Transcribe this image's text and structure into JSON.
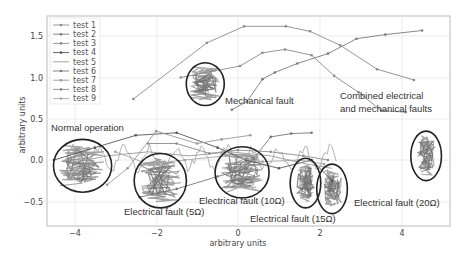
{
  "chart_data": {
    "type": "line",
    "title": "",
    "xlabel": "arbitrary units",
    "ylabel": "arbitrary units",
    "xlim": [
      -4.7,
      5.15
    ],
    "ylim": [
      -0.8,
      1.75
    ],
    "xticks": [
      -4,
      -2,
      0,
      2,
      4
    ],
    "yticks": [
      -0.5,
      0.0,
      0.5,
      1.0,
      1.5
    ],
    "grid": true,
    "legend_position": "upper left",
    "series": [
      {
        "name": "test 1",
        "color": "#8a8a8a",
        "marker": "dot",
        "points": [
          [
            -2.56,
            0.74
          ],
          [
            -0.76,
            1.42
          ],
          [
            0.15,
            1.62
          ],
          [
            1.17,
            1.62
          ],
          [
            1.76,
            1.56
          ],
          [
            2.5,
            1.39
          ],
          [
            3.4,
            1.1
          ],
          [
            4.3,
            0.97
          ]
        ]
      },
      {
        "name": "test 2",
        "color": "#7a7a7a",
        "marker": "dot",
        "points": [
          [
            -0.15,
            0.61
          ],
          [
            0.22,
            0.71
          ],
          [
            0.6,
            0.98
          ],
          [
            0.9,
            1.06
          ],
          [
            1.45,
            1.17
          ],
          [
            2.2,
            1.29
          ],
          [
            2.9,
            1.47
          ],
          [
            3.6,
            1.52
          ],
          [
            4.5,
            1.57
          ]
        ]
      },
      {
        "name": "test 3",
        "color": "#8a8a8a",
        "marker": "dot",
        "points": [
          [
            -1.4,
            1.0
          ],
          [
            0.05,
            1.14
          ],
          [
            0.6,
            1.3
          ],
          [
            1.15,
            1.34
          ],
          [
            1.8,
            1.27
          ],
          [
            2.35,
            1.02
          ],
          [
            2.95,
            0.82
          ],
          [
            3.5,
            0.6
          ],
          [
            4.1,
            0.58
          ]
        ]
      },
      {
        "name": "test 4",
        "color": "#555555",
        "marker": "dot",
        "points": [
          [
            -4.5,
            0.0
          ],
          [
            -3.5,
            0.15
          ],
          [
            -2.5,
            0.3
          ],
          [
            -1.5,
            0.33
          ],
          [
            -0.5,
            0.15
          ],
          [
            0.2,
            0.0
          ],
          [
            1.0,
            -0.1
          ],
          [
            1.8,
            0.0
          ],
          [
            2.3,
            -0.25
          ]
        ]
      },
      {
        "name": "test 5",
        "color": "#9a9a9a",
        "marker": "none",
        "points": [
          [
            -4.2,
            -0.05
          ],
          [
            -3.2,
            0.05
          ],
          [
            -2.2,
            0.1
          ],
          [
            -1.2,
            0.05
          ],
          [
            -0.2,
            0.1
          ],
          [
            0.8,
            0.05
          ],
          [
            1.7,
            -0.05
          ],
          [
            2.3,
            -0.1
          ]
        ]
      },
      {
        "name": "test 6",
        "color": "#777777",
        "marker": "dot",
        "points": [
          [
            -2.4,
            -0.45
          ],
          [
            -1.5,
            -0.35
          ],
          [
            -0.5,
            -0.2
          ],
          [
            0.2,
            -0.1
          ],
          [
            0.8,
            0.28
          ],
          [
            1.3,
            0.32
          ],
          [
            1.8,
            0.33
          ]
        ]
      },
      {
        "name": "test 7",
        "color": "#999999",
        "marker": "dot",
        "points": [
          [
            -3.2,
            -0.3
          ],
          [
            -2.7,
            -0.1
          ],
          [
            -2.0,
            0.35
          ],
          [
            -1.0,
            0.2
          ],
          [
            -0.4,
            0.25
          ],
          [
            0.3,
            0.3
          ]
        ]
      },
      {
        "name": "test 8",
        "color": "#8c8c8c",
        "marker": "dot",
        "points": [
          [
            -2.2,
            0.2
          ],
          [
            -1.5,
            0.2
          ],
          [
            -0.7,
            0.08
          ],
          [
            0.0,
            0.12
          ],
          [
            0.8,
            0.1
          ],
          [
            1.6,
            0.05
          ],
          [
            2.2,
            0.0
          ]
        ]
      },
      {
        "name": "test 9",
        "color": "#a5a5a5",
        "marker": "dot",
        "points": [
          [
            -3.0,
            0.1
          ],
          [
            -2.2,
            -0.05
          ],
          [
            -1.3,
            0.0
          ],
          [
            -0.3,
            0.05
          ],
          [
            0.6,
            -0.02
          ],
          [
            1.5,
            0.0
          ],
          [
            2.1,
            -0.05
          ]
        ]
      }
    ],
    "clusters": [
      {
        "label": "Normal operation",
        "center": [
          -3.8,
          -0.07
        ],
        "rx": 0.95,
        "ry": 0.32
      },
      {
        "label": "Mechanical fault",
        "center": [
          -0.8,
          0.92
        ],
        "rx": 0.62,
        "ry": 0.26
      },
      {
        "label": "Electrical fault (5Ω)",
        "center": [
          -1.9,
          -0.25
        ],
        "rx": 0.85,
        "ry": 0.33
      },
      {
        "label": "Electrical fault (10Ω)",
        "center": [
          0.1,
          -0.15
        ],
        "rx": 0.88,
        "ry": 0.31
      },
      {
        "label": "Electrical fault (15Ω)",
        "center": [
          1.65,
          -0.28
        ],
        "rx": 0.5,
        "ry": 0.3
      },
      {
        "label": "Electrical fault (20Ω)",
        "center": [
          2.3,
          -0.35
        ],
        "rx": 0.5,
        "ry": 0.3
      },
      {
        "label": "Combined electrical and mechanical faults",
        "center": [
          4.6,
          0.05
        ],
        "rx": 0.5,
        "ry": 0.3
      }
    ]
  },
  "legend": [
    "test 1",
    "test 2",
    "test 3",
    "test 4",
    "test 5",
    "test 6",
    "test 7",
    "test 8",
    "test 9"
  ],
  "annotations": {
    "normal": "Normal operation",
    "mechanical": "Mechanical fault",
    "e5": "Electrical fault (5Ω)",
    "e10": "Electrical fault (10Ω)",
    "e15": "Electrical fault (15Ω)",
    "e20": "Electrical fault (20Ω)",
    "combined_1": "Combined electrical",
    "combined_2": "and mechanical faults"
  },
  "axes": {
    "xlabel": "arbitrary units",
    "ylabel": "arbitrary units",
    "xticks": [
      "−4",
      "−2",
      "0",
      "2",
      "4"
    ],
    "yticks": [
      "1.5",
      "1.0",
      "0.5",
      "0.0",
      "−0.5"
    ]
  }
}
